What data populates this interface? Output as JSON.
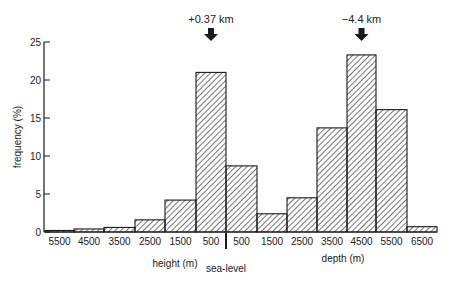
{
  "chart_data": {
    "type": "bar",
    "title": "",
    "ylabel": "frequency (%)",
    "ylim": [
      0,
      25
    ],
    "yticks": [
      0,
      5,
      10,
      15,
      20,
      25
    ],
    "grid": false,
    "legend": null,
    "categories": [
      "5500",
      "4500",
      "3500",
      "2500",
      "1500",
      "500",
      "500",
      "1500",
      "2500",
      "3500",
      "4500",
      "5500",
      "6500"
    ],
    "groups": [
      {
        "name": "height (m)",
        "categories": [
          "5500",
          "4500",
          "3500",
          "2500",
          "1500",
          "500"
        ],
        "values": [
          0.2,
          0.4,
          0.6,
          1.6,
          4.2,
          21.0
        ]
      },
      {
        "name": "depth (m)",
        "categories": [
          "500",
          "1500",
          "2500",
          "3500",
          "4500",
          "5500",
          "6500"
        ],
        "values": [
          8.7,
          2.4,
          4.5,
          13.7,
          23.3,
          16.1,
          0.7
        ]
      }
    ],
    "values": [
      0.2,
      0.4,
      0.6,
      1.6,
      4.2,
      21.0,
      8.7,
      2.4,
      4.5,
      13.7,
      23.3,
      16.1,
      0.7
    ],
    "xlabel_left": "height (m)",
    "xlabel_right": "depth (m)",
    "divider_label": "sea-level",
    "annotations": [
      {
        "text": "+0.37 km",
        "bar_index": 5,
        "marker": "down-arrow"
      },
      {
        "text": "−4.4 km",
        "bar_index": 10,
        "marker": "down-arrow"
      }
    ],
    "fill": "diagonal-hatch"
  },
  "colors": {
    "ink": "#1a1a1a",
    "background": "#ffffff"
  }
}
